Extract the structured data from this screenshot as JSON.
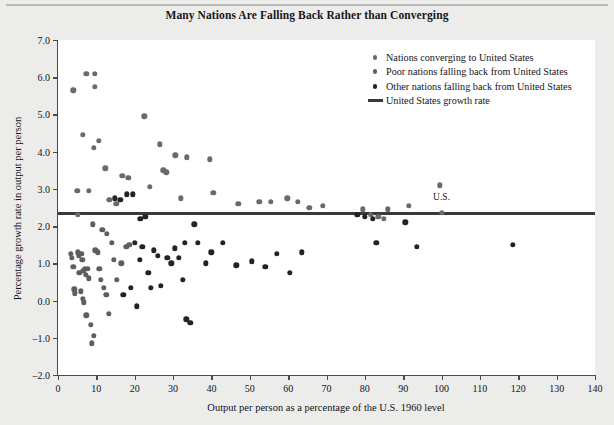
{
  "chart_data": {
    "type": "scatter",
    "title": "Many Nations Are Falling Back Rather than Converging",
    "xlabel": "Output per person as a percentage of the U.S. 1960 level",
    "ylabel": "Percentage growth rate in output per person",
    "xlim": [
      0,
      140
    ],
    "ylim": [
      -2.0,
      7.0
    ],
    "xticks": [
      0,
      10,
      20,
      30,
      40,
      50,
      60,
      70,
      80,
      90,
      100,
      110,
      120,
      130,
      140
    ],
    "xtick_labels": [
      "0",
      "10",
      "20",
      "30",
      "40",
      "50",
      "60",
      "70",
      "80",
      "90",
      "100",
      "110",
      "120",
      "130",
      "140"
    ],
    "yticks": [
      -2.0,
      -1.0,
      0.0,
      1.0,
      2.0,
      3.0,
      4.0,
      5.0,
      6.0,
      7.0
    ],
    "ytick_labels": [
      "-2.0",
      "-1.0",
      "0.0",
      "1.0",
      "2.0",
      "3.0",
      "4.0",
      "5.0",
      "6.0",
      "7.0"
    ],
    "grid": false,
    "legend_position": "top-right",
    "annotations": [
      {
        "text": "U.S.",
        "x": 100,
        "y": 2.35,
        "offset_y": 0.38
      }
    ],
    "reference_line": {
      "name": "United States growth rate",
      "orientation": "horizontal",
      "y": 2.35,
      "color": "#3a3a3d"
    },
    "legend": [
      {
        "label": "Nations converging to United States",
        "marker": "dot",
        "color": "#6a6a6c",
        "series": "converging"
      },
      {
        "label": "Poor nations falling back from United States",
        "marker": "dot",
        "color": "#5e5e60",
        "series": "poor"
      },
      {
        "label": "Other nations falling back from United States",
        "marker": "dot",
        "color": "#232326",
        "series": "other"
      },
      {
        "label": "United States growth rate",
        "marker": "line",
        "color": "#3a3a3d",
        "series": "us_line"
      }
    ],
    "series": [
      {
        "name": "Nations converging to United States",
        "color": "#6a6a6c",
        "points": [
          [
            4.0,
            5.65
          ],
          [
            7.4,
            6.1
          ],
          [
            9.6,
            6.1
          ],
          [
            9.6,
            5.75
          ],
          [
            6.4,
            4.45
          ],
          [
            9.3,
            4.1
          ],
          [
            10.6,
            4.3
          ],
          [
            12.3,
            3.55
          ],
          [
            5.0,
            2.95
          ],
          [
            8.0,
            2.95
          ],
          [
            5.1,
            2.3
          ],
          [
            13.4,
            2.7
          ],
          [
            15.2,
            2.6
          ],
          [
            22.5,
            4.95
          ],
          [
            26.5,
            4.2
          ],
          [
            27.5,
            3.5
          ],
          [
            28.2,
            3.45
          ],
          [
            24.0,
            3.05
          ],
          [
            30.6,
            3.9
          ],
          [
            33.6,
            3.85
          ],
          [
            39.5,
            3.8
          ],
          [
            16.8,
            3.35
          ],
          [
            18.3,
            3.3
          ],
          [
            32.0,
            2.75
          ],
          [
            40.5,
            2.9
          ],
          [
            47.0,
            2.6
          ],
          [
            52.5,
            2.65
          ],
          [
            55.5,
            2.65
          ],
          [
            59.8,
            2.75
          ],
          [
            62.5,
            2.65
          ],
          [
            65.5,
            2.5
          ],
          [
            69.0,
            2.55
          ],
          [
            79.5,
            2.45
          ],
          [
            81.5,
            2.3
          ],
          [
            83.5,
            2.25
          ],
          [
            85.0,
            2.2
          ],
          [
            86.0,
            2.45
          ],
          [
            91.5,
            2.55
          ],
          [
            99.5,
            3.1
          ],
          [
            100.0,
            2.35
          ]
        ]
      },
      {
        "name": "Poor nations falling back from United States",
        "color": "#5e5e60",
        "points": [
          [
            3.4,
            1.25
          ],
          [
            3.6,
            1.15
          ],
          [
            4.0,
            0.9
          ],
          [
            4.2,
            0.3
          ],
          [
            4.4,
            0.2
          ],
          [
            5.2,
            1.3
          ],
          [
            5.4,
            1.2
          ],
          [
            5.6,
            0.75
          ],
          [
            6.1,
            1.25
          ],
          [
            6.3,
            1.1
          ],
          [
            6.6,
            0.8
          ],
          [
            7.0,
            0.85
          ],
          [
            7.3,
            0.7
          ],
          [
            7.8,
            0.85
          ],
          [
            8.0,
            0.6
          ],
          [
            5.9,
            0.25
          ],
          [
            6.4,
            0.05
          ],
          [
            6.8,
            -0.05
          ],
          [
            7.4,
            -0.4
          ],
          [
            8.5,
            -0.65
          ],
          [
            8.8,
            -1.15
          ],
          [
            9.3,
            -0.95
          ],
          [
            9.7,
            1.35
          ],
          [
            10.3,
            1.3
          ],
          [
            10.8,
            0.85
          ],
          [
            11.2,
            0.55
          ],
          [
            12.0,
            0.35
          ],
          [
            12.6,
            0.15
          ],
          [
            13.2,
            -0.35
          ],
          [
            14.0,
            1.55
          ],
          [
            14.6,
            1.1
          ],
          [
            15.4,
            0.55
          ],
          [
            16.5,
            1.0
          ],
          [
            17.8,
            1.45
          ],
          [
            18.6,
            1.5
          ],
          [
            11.5,
            1.9
          ],
          [
            12.8,
            1.8
          ],
          [
            9.0,
            2.05
          ]
        ]
      },
      {
        "name": "Other nations falling back from United States",
        "color": "#232326",
        "points": [
          [
            20.0,
            1.55
          ],
          [
            21.3,
            1.1
          ],
          [
            22.0,
            1.45
          ],
          [
            23.5,
            0.75
          ],
          [
            25.0,
            1.35
          ],
          [
            26.0,
            1.2
          ],
          [
            26.8,
            0.4
          ],
          [
            24.2,
            0.35
          ],
          [
            28.5,
            1.15
          ],
          [
            29.5,
            1.0
          ],
          [
            30.5,
            1.4
          ],
          [
            31.5,
            1.15
          ],
          [
            32.5,
            0.55
          ],
          [
            33.5,
            -0.5
          ],
          [
            34.5,
            -0.6
          ],
          [
            35.5,
            2.05
          ],
          [
            36.5,
            1.55
          ],
          [
            33.0,
            1.55
          ],
          [
            19.0,
            0.35
          ],
          [
            20.5,
            -0.15
          ],
          [
            17.0,
            0.15
          ],
          [
            38.5,
            1.0
          ],
          [
            40.0,
            1.3
          ],
          [
            43.0,
            1.55
          ],
          [
            46.5,
            0.95
          ],
          [
            50.5,
            1.05
          ],
          [
            54.0,
            0.9
          ],
          [
            57.0,
            1.25
          ],
          [
            60.5,
            0.75
          ],
          [
            63.5,
            1.3
          ],
          [
            78.0,
            2.3
          ],
          [
            80.0,
            2.25
          ],
          [
            82.0,
            2.2
          ],
          [
            83.0,
            1.55
          ],
          [
            90.5,
            2.1
          ],
          [
            93.5,
            1.45
          ],
          [
            118.5,
            1.5
          ],
          [
            14.8,
            2.75
          ],
          [
            16.2,
            2.7
          ],
          [
            18.0,
            2.85
          ],
          [
            19.5,
            2.85
          ],
          [
            21.5,
            2.2
          ],
          [
            22.8,
            2.25
          ]
        ]
      }
    ]
  }
}
